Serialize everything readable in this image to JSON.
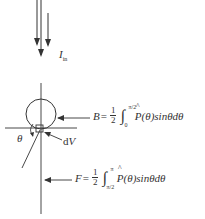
{
  "diagram": {
    "incident_label": {
      "main": "I",
      "sub": "in"
    },
    "theta_label": "θ",
    "dv_label": "dV",
    "equation_B": {
      "lhs": "B",
      "eq": "=",
      "frac_num": "1",
      "frac_den": "2",
      "integral": "∫",
      "upper": "π/2",
      "lower": "0",
      "integrand": "P(θ)sinθdθ",
      "hat": "^"
    },
    "equation_F": {
      "lhs": "F",
      "eq": "=",
      "frac_num": "1",
      "frac_den": "2",
      "integral": "∫",
      "upper": "π",
      "lower": "π/2",
      "integrand": "P(θ)sinθdθ",
      "hat": "^"
    },
    "colors": {
      "line": "#333333",
      "background": "#ffffff"
    }
  }
}
